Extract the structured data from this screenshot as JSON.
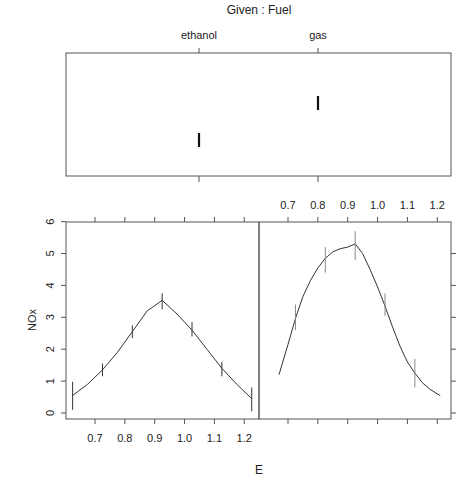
{
  "chart_data": {
    "type": "line",
    "title": "Given :  Fuel",
    "xlabel": "E",
    "ylabel": "NOx",
    "given": {
      "title": "Given :  Fuel",
      "levels": [
        "ethanol",
        "gas"
      ],
      "level_values": [
        0.31,
        0.53
      ]
    },
    "xlim": [
      0.6,
      1.25
    ],
    "ylim": [
      0,
      6
    ],
    "x_ticks": [
      "0.7",
      "0.8",
      "0.9",
      "1.0",
      "1.1",
      "1.2"
    ],
    "x_tick_values": [
      0.7,
      0.8,
      0.9,
      1.0,
      1.1,
      1.2
    ],
    "y_ticks": [
      "0",
      "1",
      "2",
      "3",
      "4",
      "5",
      "6"
    ],
    "y_tick_values": [
      0,
      1,
      2,
      3,
      4,
      5,
      6
    ],
    "grid": false,
    "panels": [
      {
        "name": "ethanol",
        "curve": {
          "x": [
            0.625,
            0.675,
            0.725,
            0.775,
            0.825,
            0.875,
            0.925,
            0.975,
            1.025,
            1.075,
            1.125,
            1.175,
            1.225
          ],
          "y": [
            0.55,
            0.9,
            1.35,
            1.9,
            2.55,
            3.2,
            3.53,
            3.1,
            2.6,
            2.0,
            1.4,
            0.9,
            0.45
          ]
        },
        "error_bars": [
          {
            "x": 0.625,
            "y": 0.53,
            "lo": 0.1,
            "hi": 0.98
          },
          {
            "x": 0.725,
            "y": 1.35,
            "lo": 1.15,
            "hi": 1.55
          },
          {
            "x": 0.825,
            "y": 2.55,
            "lo": 2.35,
            "hi": 2.75
          },
          {
            "x": 0.925,
            "y": 3.53,
            "lo": 3.25,
            "hi": 3.75
          },
          {
            "x": 1.025,
            "y": 2.6,
            "lo": 2.4,
            "hi": 2.85
          },
          {
            "x": 1.125,
            "y": 1.4,
            "lo": 1.15,
            "hi": 1.6
          },
          {
            "x": 1.225,
            "y": 0.45,
            "lo": 0.05,
            "hi": 0.8
          }
        ]
      },
      {
        "name": "gas",
        "curve": {
          "x": [
            0.67,
            0.7,
            0.725,
            0.75,
            0.775,
            0.8,
            0.825,
            0.85,
            0.875,
            0.9,
            0.925,
            0.95,
            0.975,
            1.0,
            1.025,
            1.05,
            1.075,
            1.1,
            1.125,
            1.15,
            1.175,
            1.2,
            1.21
          ],
          "y": [
            1.2,
            2.15,
            2.97,
            3.65,
            4.15,
            4.55,
            4.85,
            5.05,
            5.15,
            5.2,
            5.3,
            5.0,
            4.5,
            3.95,
            3.35,
            2.7,
            2.1,
            1.6,
            1.25,
            0.95,
            0.75,
            0.6,
            0.55
          ]
        },
        "error_bars": [
          {
            "x": 0.725,
            "y": 2.97,
            "lo": 2.6,
            "hi": 3.4
          },
          {
            "x": 0.825,
            "y": 4.8,
            "lo": 4.4,
            "hi": 5.2
          },
          {
            "x": 0.925,
            "y": 5.3,
            "lo": 4.8,
            "hi": 5.7
          },
          {
            "x": 1.025,
            "y": 3.4,
            "lo": 3.05,
            "hi": 3.75
          },
          {
            "x": 1.125,
            "y": 1.25,
            "lo": 0.8,
            "hi": 1.7
          }
        ]
      }
    ]
  }
}
